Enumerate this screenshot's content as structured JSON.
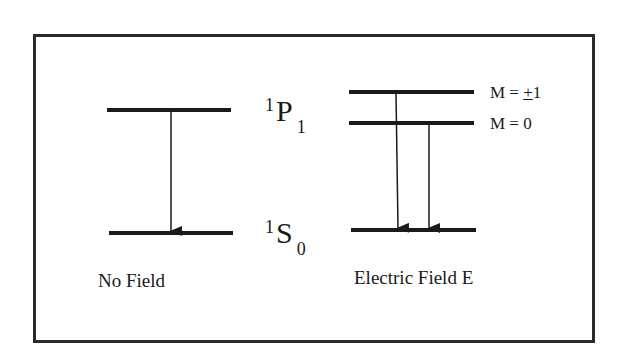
{
  "diagram": {
    "type": "energy-level-diagram",
    "panels": [
      {
        "id": "no-field",
        "caption": "No Field",
        "levels": [
          {
            "id": "upper",
            "term": "1P1"
          },
          {
            "id": "lower",
            "term": "1S0"
          }
        ],
        "transitions": [
          {
            "from": "upper",
            "to": "lower"
          }
        ]
      },
      {
        "id": "electric-field",
        "caption": "Electric Field E",
        "levels": [
          {
            "id": "m-pm1",
            "label": "M = ±1"
          },
          {
            "id": "m-0",
            "label": "M = 0"
          },
          {
            "id": "ground",
            "term": "1S0"
          }
        ],
        "transitions": [
          {
            "from": "m-pm1",
            "to": "ground"
          },
          {
            "from": "m-0",
            "to": "ground"
          }
        ]
      }
    ],
    "terms": {
      "upper": {
        "mult": "1",
        "letter": "P",
        "j": "1"
      },
      "lower": {
        "mult": "1",
        "letter": "S",
        "j": "0"
      }
    },
    "m_labels": {
      "m_pm1_prefix": "M = ",
      "m_pm1_sign": "+",
      "m_pm1_value": "1",
      "m_0": "M = 0"
    },
    "captions": {
      "no_field": "No Field",
      "electric_field": "Electric Field E"
    },
    "colors": {
      "line": "#1a1a1a",
      "frame": "#2a2a2a",
      "background": "#ffffff"
    }
  }
}
